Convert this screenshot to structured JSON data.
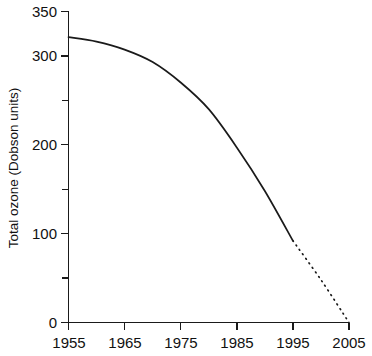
{
  "figure": {
    "background_color": "#ffffff",
    "line_color": "#1a1a1a",
    "title": "",
    "width": 372,
    "height": 356
  },
  "axes": {
    "y_title": "Total ozone (Dobson units)",
    "x_title": "",
    "y_ticks_major": [
      "0",
      "100",
      "200",
      "300",
      "350"
    ],
    "y_ticks_minor": [
      "50",
      "150",
      "250"
    ],
    "x_ticks": [
      "1955",
      "1965",
      "1975",
      "1985",
      "1995",
      "2005"
    ]
  },
  "chart_data": {
    "type": "line",
    "title": "",
    "xlabel": "",
    "ylabel": "Total ozone (Dobson units)",
    "xlim": [
      1955,
      2005
    ],
    "ylim": [
      0,
      350
    ],
    "grid": false,
    "legend": "none",
    "x_tick_labels": [
      "1955",
      "1965",
      "1975",
      "1985",
      "1995",
      "2005"
    ],
    "x_tick_values": [
      1955,
      1965,
      1975,
      1985,
      1995,
      2005
    ],
    "y_tick_labels": [
      "0",
      "100",
      "200",
      "300",
      "350"
    ],
    "y_tick_values": [
      0,
      100,
      200,
      300,
      350
    ],
    "y_minor_tick_values": [
      50,
      150,
      250
    ],
    "series": [
      {
        "name": "Observed total ozone",
        "style": "solid",
        "x": [
          1955,
          1960,
          1965,
          1970,
          1975,
          1980,
          1985,
          1990,
          1995
        ],
        "values": [
          321,
          316,
          307,
          293,
          270,
          240,
          197,
          148,
          92
        ]
      },
      {
        "name": "Projected total ozone",
        "style": "dotted",
        "x": [
          1995,
          2000,
          2005
        ],
        "values": [
          92,
          48,
          0
        ]
      }
    ]
  }
}
